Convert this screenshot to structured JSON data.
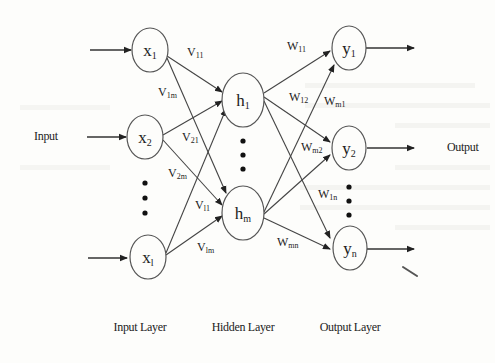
{
  "diagram": {
    "type": "neural-network",
    "io": {
      "input_label": "Input",
      "output_label": "Output"
    },
    "layers": [
      {
        "name": "Input Layer",
        "nodes": [
          {
            "label": "x",
            "sub": "1"
          },
          {
            "label": "x",
            "sub": "2"
          },
          {
            "label": "x",
            "sub": "l"
          }
        ]
      },
      {
        "name": "Hidden Layer",
        "nodes": [
          {
            "label": "h",
            "sub": "1"
          },
          {
            "label": "h",
            "sub": "m"
          }
        ]
      },
      {
        "name": "Output Layer",
        "nodes": [
          {
            "label": "y",
            "sub": "1"
          },
          {
            "label": "y",
            "sub": "2"
          },
          {
            "label": "y",
            "sub": "n"
          }
        ]
      }
    ],
    "layer_labels": {
      "input": "Input Layer",
      "hidden": "Hidden Layer",
      "output": "Output Layer"
    },
    "nodes": {
      "x1": {
        "main": "x",
        "sub": "1"
      },
      "x2": {
        "main": "x",
        "sub": "2"
      },
      "xl": {
        "main": "x",
        "sub": "l"
      },
      "h1": {
        "main": "h",
        "sub": "1"
      },
      "hm": {
        "main": "h",
        "sub": "m"
      },
      "y1": {
        "main": "y",
        "sub": "1"
      },
      "y2": {
        "main": "y",
        "sub": "2"
      },
      "yn": {
        "main": "y",
        "sub": "n"
      }
    },
    "weights_input_hidden": {
      "v11": {
        "main": "V",
        "sub": "11"
      },
      "v1m": {
        "main": "V",
        "sub": "1m"
      },
      "v21": {
        "main": "V",
        "sub": "21"
      },
      "v2m": {
        "main": "V",
        "sub": "2m"
      },
      "vl1": {
        "main": "V",
        "sub": "l1"
      },
      "vlm": {
        "main": "V",
        "sub": "lm"
      }
    },
    "weights_hidden_output": {
      "w11": {
        "main": "W",
        "sub": "11"
      },
      "w12": {
        "main": "W",
        "sub": "12"
      },
      "w1n": {
        "main": "W",
        "sub": "1n"
      },
      "wm1": {
        "main": "W",
        "sub": "m1"
      },
      "wm2": {
        "main": "W",
        "sub": "m2"
      },
      "wmn": {
        "main": "W",
        "sub": "mn"
      }
    },
    "edges": [
      [
        "x1",
        "h1",
        "v11"
      ],
      [
        "x1",
        "hm",
        "v1m"
      ],
      [
        "x2",
        "h1",
        "v21"
      ],
      [
        "x2",
        "hm",
        "v2m"
      ],
      [
        "xl",
        "h1",
        "vl1"
      ],
      [
        "xl",
        "hm",
        "vlm"
      ],
      [
        "h1",
        "y1",
        "w11"
      ],
      [
        "h1",
        "y2",
        "w12"
      ],
      [
        "h1",
        "yn",
        "w1n"
      ],
      [
        "hm",
        "y1",
        "wm1"
      ],
      [
        "hm",
        "y2",
        "wm2"
      ],
      [
        "hm",
        "yn",
        "wmn"
      ]
    ],
    "colors": {
      "background": "#fdfdfb",
      "stroke": "#555555",
      "text": "#222222"
    }
  }
}
